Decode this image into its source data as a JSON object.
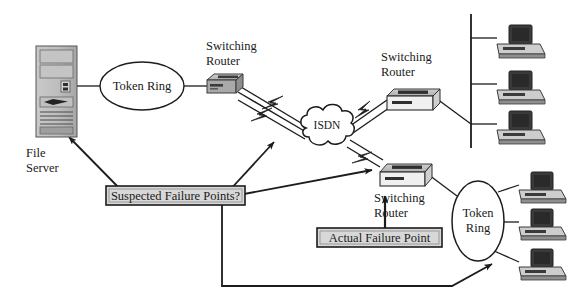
{
  "diagram": {
    "background_color": "#ffffff",
    "line_color": "#1c1c1c",
    "text_color": "#1a1a1a",
    "device_fill": "#b9b9b9",
    "device_dark": "#3a3a3a",
    "callout_fill": "#d8d8d8"
  },
  "nodes": {
    "file_server": {
      "label_line1": "File",
      "label_line2": "Server",
      "icon": "tower-server-icon"
    },
    "token_ring_left": {
      "label": "Token Ring",
      "icon": "ellipse-cloud-icon"
    },
    "token_ring_right": {
      "label_line1": "Token",
      "label_line2": "Ring",
      "icon": "ellipse-cloud-icon"
    },
    "isdn": {
      "label": "ISDN",
      "icon": "cloud-icon"
    },
    "router_left": {
      "label_line1": "Switching",
      "label_line2": "Router",
      "icon": "router-icon"
    },
    "router_top_right": {
      "label_line1": "Switching",
      "label_line2": "Router",
      "icon": "router-icon"
    },
    "router_bottom_right": {
      "label_line1": "Switching",
      "label_line2": "Router",
      "icon": "router-icon"
    },
    "workstations_top": [
      {
        "name": "workstation-top-1",
        "icon": "workstation-icon"
      },
      {
        "name": "workstation-top-2",
        "icon": "workstation-icon"
      },
      {
        "name": "workstation-top-3",
        "icon": "workstation-icon"
      }
    ],
    "workstations_bottom": [
      {
        "name": "workstation-bottom-1",
        "icon": "workstation-icon"
      },
      {
        "name": "workstation-bottom-2",
        "icon": "workstation-icon"
      },
      {
        "name": "workstation-bottom-3",
        "icon": "workstation-icon"
      }
    ]
  },
  "callouts": {
    "suspected": {
      "label": "Suspected Failure Points?"
    },
    "actual": {
      "label": "Actual Failure Point"
    }
  }
}
